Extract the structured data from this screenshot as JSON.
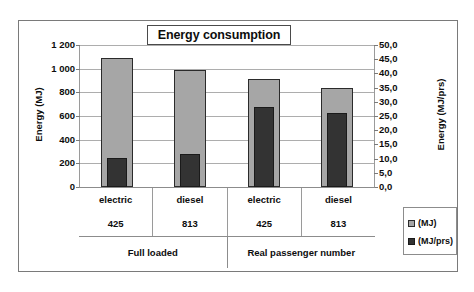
{
  "chart_data": {
    "type": "bar",
    "title": "Energy consumption",
    "categories": [
      "electric 425 / Full loaded",
      "diesel 813 / Full loaded",
      "electric 425 / Real passenger number",
      "diesel 813 / Real passenger number"
    ],
    "category_levels": {
      "mode": [
        "electric",
        "diesel",
        "electric",
        "diesel"
      ],
      "count": [
        "425",
        "813",
        "425",
        "813"
      ],
      "group": [
        "Full loaded",
        "Real passenger number"
      ],
      "group_spans": [
        2,
        2
      ]
    },
    "series": [
      {
        "name": "(MJ)",
        "axis": "left",
        "unit": "MJ",
        "color": "#a6a6a6",
        "values": [
          1090,
          990,
          915,
          840
        ]
      },
      {
        "name": "(MJ/prs)",
        "axis": "right",
        "unit": "MJ/prs",
        "color": "#333333",
        "values": [
          10.2,
          11.8,
          28.3,
          26.2
        ]
      }
    ],
    "xlabel": "",
    "ylabel": "Energy (MJ)",
    "y2label": "Energy (MJ/prs)",
    "ylim": [
      0,
      1200
    ],
    "y2lim": [
      0,
      50
    ],
    "yticks": [
      "0",
      "200",
      "400",
      "600",
      "800",
      "1 000",
      "1 200"
    ],
    "ytick_values": [
      0,
      200,
      400,
      600,
      800,
      1000,
      1200
    ],
    "y2ticks": [
      "0,0",
      "5,0",
      "10,0",
      "15,0",
      "20,0",
      "25,0",
      "30,0",
      "35,0",
      "40,0",
      "45,0",
      "50,0"
    ],
    "y2tick_values": [
      0,
      5,
      10,
      15,
      20,
      25,
      30,
      35,
      40,
      45,
      50
    ],
    "grid": true,
    "legend_position": "right",
    "legend": [
      "(MJ)",
      "(MJ/prs)"
    ]
  },
  "legend": {
    "items": [
      {
        "label": "(MJ)",
        "swatch": "legend-swatch-mj"
      },
      {
        "label": "(MJ/prs)",
        "swatch": "legend-swatch-mjprs"
      }
    ]
  }
}
